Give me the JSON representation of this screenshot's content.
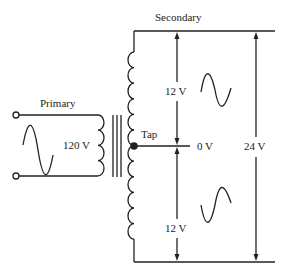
{
  "diagram": {
    "type": "center-tapped transformer",
    "labels": {
      "primary": "Primary",
      "secondary": "Secondary",
      "primary_voltage": "120 V",
      "tap": "Tap",
      "tap_voltage": "0 V",
      "upper_half_voltage": "12 V",
      "lower_half_voltage": "12 V",
      "total_voltage": "24 V"
    },
    "colors": {
      "line": "#222222",
      "background": "#ffffff"
    }
  }
}
